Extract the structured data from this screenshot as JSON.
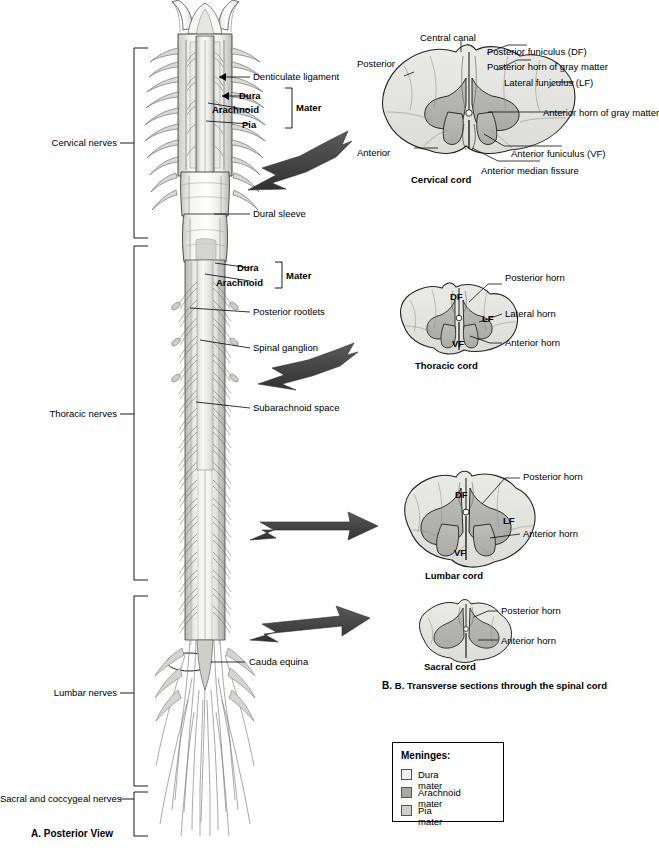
{
  "figure": {
    "panel_a_caption": "A. Posterior View",
    "panel_b_caption": "B. Transverse sections through the spinal cord",
    "panel_b_caption_letter": "B."
  },
  "region_brackets": [
    {
      "label": "Cervical nerves",
      "y": 143
    },
    {
      "label": "Thoracic nerves",
      "y": 414
    },
    {
      "label": "Lumbar nerves",
      "y": 693
    },
    {
      "label": "Sacral and coccygeal nerves",
      "y": 799
    }
  ],
  "posterior_view_labels": [
    {
      "text": "Denticulate ligament",
      "bold": false
    },
    {
      "text": "Dura",
      "bold": true
    },
    {
      "text": "Arachnoid",
      "bold": true
    },
    {
      "text": "Pia",
      "bold": true
    },
    {
      "text": "Mater",
      "bold": true
    },
    {
      "text": "Dural sleeve",
      "bold": false
    },
    {
      "text": "Dura",
      "bold": true
    },
    {
      "text": "Arachnoid",
      "bold": true
    },
    {
      "text": "Mater",
      "bold": true
    },
    {
      "text": "Posterior rootlets",
      "bold": false
    },
    {
      "text": "Spinal ganglion",
      "bold": false
    },
    {
      "text": "Subarachnoid space",
      "bold": false
    },
    {
      "text": "Cauda equina",
      "bold": false
    }
  ],
  "sections": {
    "cervical": {
      "title": "Cervical cord",
      "labels": {
        "posterior": "Posterior",
        "anterior": "Anterior",
        "central_canal": "Central canal",
        "posterior_funiculus": "Posterior funiculus (DF)",
        "posterior_horn": "Posterior horn of gray matter",
        "lateral_funiculus": "Lateral funiculus (LF)",
        "anterior_horn": "Anterior horn of gray matter",
        "anterior_funiculus": "Anterior funiculus (VF)",
        "anterior_median_fissure": "Anterior median fissure"
      }
    },
    "thoracic": {
      "title": "Thoracic cord",
      "inner": [
        "DF",
        "LF",
        "VF"
      ],
      "labels": {
        "posterior_horn": "Posterior horn",
        "lateral_horn": "Lateral horn",
        "anterior_horn": "Anterior horn"
      }
    },
    "lumbar": {
      "title": "Lumbar cord",
      "inner": [
        "DF",
        "LF",
        "VF"
      ],
      "labels": {
        "posterior_horn": "Posterior horn",
        "anterior_horn": "Anterior horn"
      }
    },
    "sacral": {
      "title": "Sacral cord",
      "labels": {
        "posterior_horn": "Posterior horn",
        "anterior_horn": "Anterior horn"
      }
    }
  },
  "legend": {
    "title": "Meninges:",
    "items": [
      {
        "label": "Dura mater",
        "color": "#efefed"
      },
      {
        "label": "Arachnoid mater",
        "color": "#a8a8a4"
      },
      {
        "label": "Pia mater",
        "color": "#cfcfcb"
      }
    ]
  },
  "colors": {
    "white_matter": "#e3e3e0",
    "gray_matter": "#b4b4b0",
    "arrow": "#4a4a4a",
    "outline": "#1a1a1a",
    "cord_light": "#f0f0ee",
    "cord_mid": "#d6d6d2",
    "cord_shadow": "#9a9a96"
  }
}
